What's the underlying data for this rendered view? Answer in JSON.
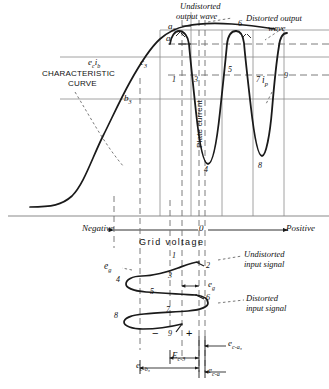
{
  "figure": {
    "title_hidden": "",
    "axis": {
      "negative": "Negative",
      "positive": "Positive",
      "origin": "0",
      "grid_voltage": "Grid  voltage",
      "plate_current": "Plate current"
    },
    "curve_labels": {
      "characteristic_line1": "CHARACTERISTIC",
      "characteristic_line2": "CURVE",
      "ec_ib": "e",
      "ec_ib_sub1": "c",
      "ec_ib_sub2": "i",
      "ec_ib_sub3": "b",
      "point_c3": "c",
      "point_c3_sub": "3",
      "point_b3": "b",
      "point_b3_sub": "3",
      "point_a3": "a",
      "point_a3_sub": "3",
      "point_a": "a"
    },
    "annotations": {
      "undistorted_output_l1": "Undistorted",
      "undistorted_output_l2": "output wave",
      "distorted_output_l1": "Distorted output",
      "distorted_output_l2": "wave",
      "undistorted_input_l1": "Undistorted",
      "undistorted_input_l2": "input signal",
      "distorted_input_l1": "Distorted",
      "distorted_input_l2": "input signal",
      "ip": "i",
      "ip_sub": "p",
      "eg": "e",
      "eg_sub": "g",
      "ig": "e",
      "ig_sub": "g"
    },
    "bias_labels": {
      "minus": "−",
      "plus": "+",
      "ec_a3": "e",
      "ec_a3_sub": "c-a₃",
      "Ec3": "E",
      "Ec3_sub": "c-3",
      "ec_b3": "e",
      "ec_b3_sub": "c-b₃",
      "ec_a": "e",
      "ec_a_sub": "c-a"
    },
    "wave_points": [
      "1",
      "2",
      "3",
      "4",
      "5",
      "6",
      "7",
      "8",
      "9"
    ],
    "colors": {
      "ink": "#1a1a1a",
      "grid": "#7a7a7a",
      "dash": "#6e6e6e",
      "paper": "#ffffff"
    }
  }
}
